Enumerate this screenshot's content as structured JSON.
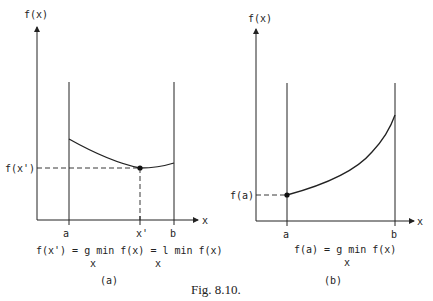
{
  "caption": "Fig. 8.10.",
  "colors": {
    "ink": "#222222",
    "background": "#ffffff"
  },
  "panel_a": {
    "label": "(a)",
    "y_axis_label": "f(x)",
    "x_axis_label": "x",
    "x_ticks": [
      "a",
      "x'",
      "b"
    ],
    "y_marker": "f(x')",
    "equation_line1": "f(x') = g min f(x) = l min f(x)",
    "equation_sub1": "x",
    "equation_sub2": "x",
    "curve": "convex curve on [a,b] with interior minimum at x'"
  },
  "panel_b": {
    "label": "(b)",
    "y_axis_label": "f(x)",
    "x_axis_label": "x",
    "x_ticks": [
      "a",
      "b"
    ],
    "y_marker": "f(a)",
    "equation_line1": "f(a) = g min f(x)",
    "equation_sub1": "x",
    "curve": "increasing curve on [a,b] with minimum at endpoint a"
  }
}
